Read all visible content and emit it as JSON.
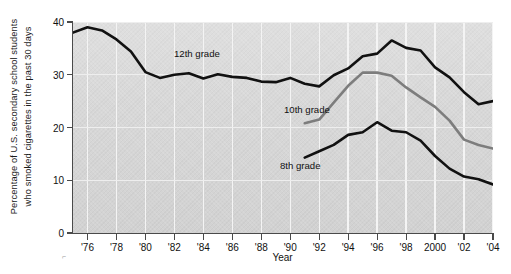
{
  "chart_data": {
    "type": "line",
    "title": "",
    "xlabel": "Year",
    "ylabel": "Percentage of U.S. secondary school students who smoked cigarettes in the past 30 days",
    "ylabel_line1": "Percentage of U.S. secondary school students",
    "ylabel_line2": "who smoked cigarettes in the past 30 days",
    "xlim": [
      1975,
      2004
    ],
    "ylim": [
      0,
      40
    ],
    "yticks": [
      0,
      10,
      20,
      30,
      40
    ],
    "ytick_labels": [
      "0",
      "10",
      "20",
      "30",
      "40"
    ],
    "xticks": [
      1976,
      1978,
      1980,
      1982,
      1984,
      1986,
      1988,
      1990,
      1992,
      1994,
      1996,
      1998,
      2000,
      2002,
      2004
    ],
    "xtick_labels": [
      "'76",
      "'78",
      "'80",
      "'82",
      "'84",
      "'86",
      "'88",
      "'90",
      "'92",
      "'94",
      "'96",
      "'98",
      "2000",
      "'02",
      "'04"
    ],
    "grid": "vertical-white-gridlines-at-even-years",
    "legend_position": "inline-annotations",
    "plot_background": "#d6d6d6",
    "series": [
      {
        "name": "12th grade",
        "color": "#111111",
        "x": [
          1975,
          1976,
          1977,
          1978,
          1979,
          1980,
          1981,
          1982,
          1983,
          1984,
          1985,
          1986,
          1987,
          1988,
          1989,
          1990,
          1991,
          1992,
          1993,
          1994,
          1995,
          1996,
          1997,
          1998,
          1999,
          2000,
          2001,
          2002,
          2003,
          2004
        ],
        "values": [
          38.0,
          39.0,
          38.4,
          36.7,
          34.4,
          30.5,
          29.4,
          30.0,
          30.3,
          29.3,
          30.1,
          29.6,
          29.4,
          28.7,
          28.6,
          29.4,
          28.3,
          27.8,
          29.9,
          31.2,
          33.5,
          34.0,
          36.5,
          35.1,
          34.6,
          31.4,
          29.5,
          26.7,
          24.4,
          25.0
        ]
      },
      {
        "name": "10th grade",
        "color": "#7d7d7d",
        "x": [
          1991,
          1992,
          1993,
          1994,
          1995,
          1996,
          1997,
          1998,
          1999,
          2000,
          2001,
          2002,
          2003,
          2004
        ],
        "values": [
          20.8,
          21.5,
          24.7,
          27.9,
          30.4,
          30.4,
          29.8,
          27.6,
          25.7,
          23.9,
          21.3,
          17.7,
          16.7,
          16.0
        ]
      },
      {
        "name": "8th grade",
        "color": "#111111",
        "x": [
          1991,
          1992,
          1993,
          1994,
          1995,
          1996,
          1997,
          1998,
          1999,
          2000,
          2001,
          2002,
          2003,
          2004
        ],
        "values": [
          14.3,
          15.5,
          16.7,
          18.6,
          19.1,
          21.0,
          19.4,
          19.1,
          17.5,
          14.6,
          12.2,
          10.7,
          10.2,
          9.2
        ]
      }
    ],
    "annotations": [
      {
        "text": "12th grade",
        "series": "12th grade"
      },
      {
        "text": "10th grade",
        "series": "10th grade"
      },
      {
        "text": "8th grade",
        "series": "8th grade"
      }
    ]
  },
  "axes": {
    "y_title_line1": "Percentage of U.S. secondary school students",
    "y_title_line2": "who smoked cigarettes in the past 30 days",
    "x_title": "Year"
  },
  "ticks": {
    "y": [
      "40",
      "30",
      "20",
      "10",
      "0"
    ],
    "x": [
      "'76",
      "'78",
      "'80",
      "'82",
      "'84",
      "'86",
      "'88",
      "'90",
      "'92",
      "'94",
      "'96",
      "'98",
      "2000",
      "'02",
      "'04"
    ]
  },
  "labels": {
    "grade12": "12th grade",
    "grade10": "10th grade",
    "grade8": "8th grade"
  },
  "marks": {
    "corner_artifact": "⌐"
  },
  "colors": {
    "series_dark": "#111111",
    "series_gray": "#7d7d7d",
    "plot_bg": "#d6d6d6",
    "page_bg": "#ffffff",
    "axis": "#4a4a4a",
    "gridline": "#f4f4f4"
  }
}
